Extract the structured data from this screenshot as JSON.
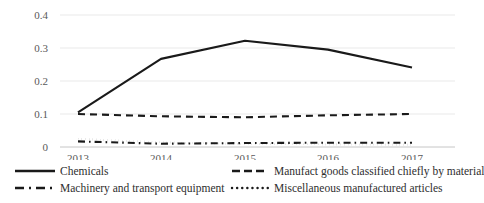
{
  "chart_data": {
    "type": "line",
    "title": "",
    "xlabel": "",
    "ylabel": "",
    "categories": [
      "2013",
      "2014",
      "2015",
      "2016",
      "2017"
    ],
    "ylim": [
      0,
      0.4
    ],
    "yticks": [
      "0",
      "0.1",
      "0.2",
      "0.3",
      "0.4"
    ],
    "ytick_values": [
      0,
      0.1,
      0.2,
      0.3,
      0.4
    ],
    "grid": true,
    "legend_position": "bottom",
    "series": [
      {
        "name": "Chemicals",
        "style": "solid",
        "color": "#1a1a1a",
        "values": [
          0.105,
          0.267,
          0.322,
          0.295,
          0.241
        ]
      },
      {
        "name": "Manufact goods classified chiefly by material",
        "style": "dashed",
        "color": "#1a1a1a",
        "values": [
          0.1,
          0.093,
          0.09,
          0.096,
          0.1
        ]
      },
      {
        "name": "Machinery and transport equipment",
        "style": "dash-dot",
        "color": "#1a1a1a",
        "values": [
          0.017,
          0.01,
          0.012,
          0.013,
          0.013
        ]
      },
      {
        "name": "Miscellaneous manufactured articles",
        "style": "dotted",
        "color": "#1a1a1a",
        "values": [
          0.025,
          0.014,
          0.009,
          0.008,
          0.007
        ]
      }
    ]
  },
  "legend": {
    "items": [
      {
        "label": "Chemicals",
        "marker": "solid-line-marker"
      },
      {
        "label": "Manufact goods classified chiefly by material",
        "marker": "dashed-line-marker"
      },
      {
        "label": "Machinery and transport equipment",
        "marker": "dash-dot-line-marker"
      },
      {
        "label": "Miscellaneous manufactured articles",
        "marker": "dotted-line-marker"
      }
    ]
  },
  "axes": {
    "y": {
      "labels": [
        "0.4",
        "0.3",
        "0.2",
        "0.1",
        "0"
      ]
    },
    "x": {
      "labels": [
        "2013",
        "2014",
        "2015",
        "2016",
        "2017"
      ]
    }
  }
}
